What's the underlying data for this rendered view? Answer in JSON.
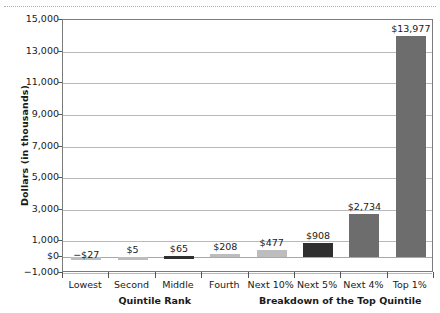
{
  "chart_data": {
    "type": "bar",
    "title": "",
    "xlabel": "",
    "ylabel": "Dollars (in thousands)",
    "categories": [
      "Lowest",
      "Second",
      "Middle",
      "Fourth",
      "Next 10%",
      "Next 5%",
      "Next 4%",
      "Top 1%"
    ],
    "values": [
      -27,
      5,
      65,
      208,
      477,
      908,
      2734,
      13977
    ],
    "value_labels": [
      "−$27",
      "$5",
      "$65",
      "$208",
      "$477",
      "$908",
      "$2,734",
      "$13,977"
    ],
    "bar_shades": [
      "light",
      "light",
      "darker",
      "light",
      "light",
      "darker",
      "dark",
      "dark"
    ],
    "ylim": [
      -1000,
      15000
    ],
    "ytick_values": [
      15000,
      13000,
      11000,
      9000,
      7000,
      5000,
      3000,
      1000,
      0,
      -1000
    ],
    "ytick_labels": [
      "15,000",
      "13,000",
      "11,000",
      "9,000",
      "7,000",
      "5,000",
      "3,000",
      "1,000",
      "$0",
      "−1,000"
    ],
    "grid": true,
    "legend": "none",
    "group_labels": [
      {
        "text": "Quintile Rank",
        "covers": [
          "Lowest",
          "Second",
          "Middle",
          "Fourth"
        ]
      },
      {
        "text": "Breakdown of the Top Quintile",
        "covers": [
          "Next 10%",
          "Next 5%",
          "Next 4%",
          "Top 1%"
        ]
      }
    ],
    "colors": {
      "light": "#bdbdbd",
      "dark": "#6d6d6d",
      "darker": "#2f2f2f",
      "gridline": "#b9b9b9",
      "axis": "#7b7b7b",
      "text": "#1a1a1a"
    }
  }
}
